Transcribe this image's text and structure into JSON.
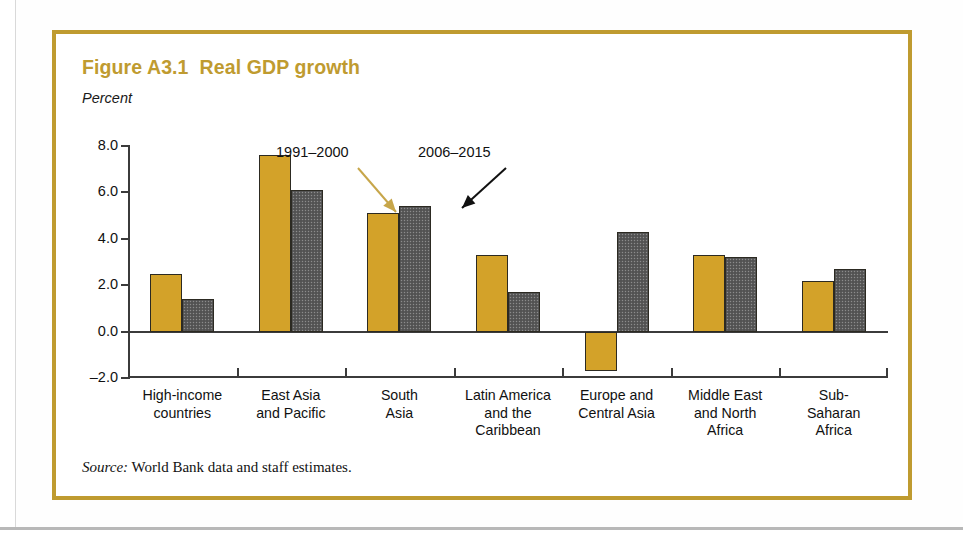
{
  "figure": {
    "title": "Figure A3.1  Real GDP growth",
    "unit_label": "Percent",
    "source_prefix": "Source:",
    "source_text": " World Bank data and staff estimates.",
    "border_color": "#bf9b30",
    "title_color": "#bf9b30"
  },
  "annotations": {
    "series1_callout": "1991–2000",
    "series2_callout": "2006–2015"
  },
  "chart_data": {
    "type": "bar",
    "title": "Figure A3.1  Real GDP growth",
    "xlabel": "",
    "ylabel": "Percent",
    "ylim": [
      -2.0,
      8.0
    ],
    "yticks": [
      "8.0",
      "6.0",
      "4.0",
      "2.0",
      "0.0",
      "–2.0"
    ],
    "ytick_values": [
      8.0,
      6.0,
      4.0,
      2.0,
      0.0,
      -2.0
    ],
    "grid": false,
    "legend_position": "inline-callouts",
    "categories": [
      "High-income countries",
      "East Asia and Pacific",
      "South Asia",
      "Latin America and the Caribbean",
      "Europe and Central Asia",
      "Middle East and North Africa",
      "Sub-Saharan Africa"
    ],
    "category_lines": [
      [
        "High-income",
        "countries"
      ],
      [
        "East Asia",
        "and Pacific"
      ],
      [
        "South",
        "Asia"
      ],
      [
        "Latin America",
        "and the",
        "Caribbean"
      ],
      [
        "Europe and",
        "Central Asia"
      ],
      [
        "Middle East",
        "and North",
        "Africa"
      ],
      [
        "Sub-",
        "Saharan",
        "Africa"
      ]
    ],
    "series": [
      {
        "name": "1991–2000",
        "color": "#d3a229",
        "values": [
          2.5,
          7.6,
          5.1,
          3.3,
          -1.7,
          3.3,
          2.2
        ]
      },
      {
        "name": "2006–2015",
        "color": "#5a5a5a",
        "values": [
          1.4,
          6.1,
          5.4,
          1.7,
          4.3,
          3.2,
          2.7
        ]
      }
    ]
  }
}
